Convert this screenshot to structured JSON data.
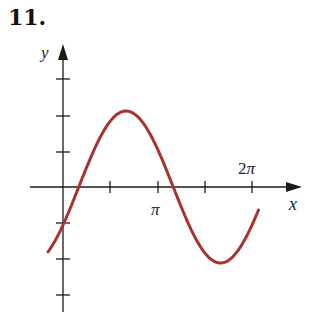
{
  "problem_number": "11.",
  "chart_data": {
    "type": "line",
    "title": "",
    "xlabel": "x",
    "ylabel": "y",
    "x_tick_labels": [
      {
        "x": 3.14159,
        "label": "π"
      },
      {
        "x": 6.28318,
        "label": "2π"
      }
    ],
    "x_ticks": [
      1.5708,
      3.14159,
      4.7124,
      6.28318
    ],
    "y_ticks": [
      -3,
      -2,
      -1,
      1,
      2,
      3
    ],
    "xlim": [
      -0.5,
      7.5
    ],
    "ylim": [
      -3.3,
      3.3
    ],
    "grid": false,
    "series": [
      {
        "name": "curve",
        "color": "#a83232",
        "function": "y = 2 sin(x - π/6)",
        "x": [
          -0.5,
          0,
          0.5236,
          2.0944,
          3.6652,
          5.236,
          6.5
        ],
        "y": [
          -1.7,
          -1.0,
          0,
          2.0,
          0,
          -2.0,
          0.3
        ]
      }
    ]
  },
  "colors": {
    "axis": "#1a1a1a",
    "curve": "#a83232"
  }
}
